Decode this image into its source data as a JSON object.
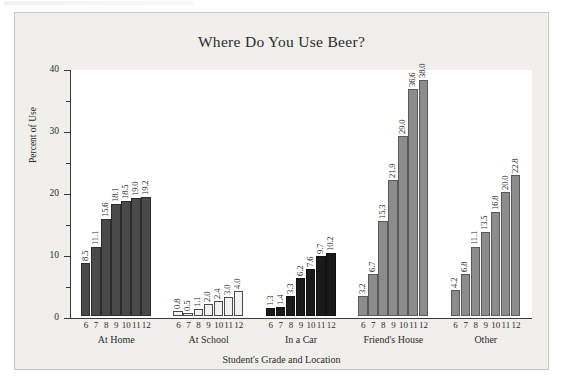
{
  "figure": {
    "title": "Where Do You Use Beer?",
    "scan_artifact": ""
  },
  "chart_data": {
    "type": "bar",
    "title": "Where Do You Use Beer?",
    "xlabel": "Student's Grade and Location",
    "ylabel": "Percent of Use",
    "ylim": [
      0,
      40
    ],
    "yticks": [
      0,
      10,
      20,
      30,
      40
    ],
    "yticks_minor": [
      5,
      15,
      25,
      35
    ],
    "ytick_labels": [
      "0",
      "10",
      "20",
      "30",
      "40"
    ],
    "grid": false,
    "legend": "none",
    "categories": [
      "6",
      "7",
      "8",
      "9",
      "10",
      "11",
      "12"
    ],
    "category_label": "grade",
    "groups": [
      {
        "name": "At Home",
        "color": "#4a4a4a",
        "edge": "#2b2b2b",
        "values": [
          8.5,
          11.1,
          15.6,
          18.1,
          18.5,
          19.0,
          19.2
        ],
        "value_labels": [
          "8.5",
          "11.1",
          "15.6",
          "18.1",
          "18.5",
          "19.0",
          "19.2"
        ]
      },
      {
        "name": "At School",
        "color": "#f2f2f2",
        "edge": "#4a4a4a",
        "values": [
          0.8,
          0.5,
          1.1,
          2.0,
          2.4,
          3.0,
          4.0
        ],
        "value_labels": [
          "0.8",
          "0.5",
          "1.1",
          "2.0",
          "2.4",
          "3.0",
          "4.0"
        ]
      },
      {
        "name": "In a Car",
        "color": "#1a1a1a",
        "edge": "#111111",
        "values": [
          1.3,
          1.4,
          3.3,
          6.2,
          7.6,
          9.7,
          10.2
        ],
        "value_labels": [
          "1.3",
          "1.4",
          "3.3",
          "6.2",
          "7.6",
          "9.7",
          "10.2"
        ]
      },
      {
        "name": "Friend's House",
        "color": "#8c8c8c",
        "edge": "#5a5a5a",
        "values": [
          3.2,
          6.7,
          15.3,
          21.9,
          29.0,
          36.6,
          38.0
        ],
        "value_labels": [
          "3.2",
          "6.7",
          "15.3",
          "21.9",
          "29.0",
          "36.6",
          "38.0"
        ]
      },
      {
        "name": "Other",
        "color": "#8c8c8c",
        "edge": "#5a5a5a",
        "values": [
          4.2,
          6.8,
          11.1,
          13.5,
          16.8,
          20.0,
          22.8
        ],
        "value_labels": [
          "4.2",
          "6.8",
          "11.1",
          "13.5",
          "16.8",
          "20.0",
          "22.8"
        ]
      }
    ]
  }
}
